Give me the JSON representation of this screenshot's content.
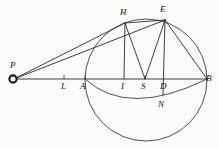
{
  "figure": {
    "kind": "geometry-diagram",
    "caption": "",
    "background_color": "#fbfbfa",
    "ink_color": "#2a2a2a",
    "width": 219,
    "height": 148
  },
  "points": [
    {
      "id": "P",
      "label": "P",
      "x": 13,
      "y": 79,
      "label_x": 10,
      "label_y": 61,
      "marker": "open-circle"
    },
    {
      "id": "L",
      "label": "L",
      "x": 64,
      "y": 79,
      "label_x": 61,
      "label_y": 82,
      "marker": "tick"
    },
    {
      "id": "A",
      "label": "A",
      "x": 85,
      "y": 79,
      "label_x": 80,
      "label_y": 82,
      "marker": "tick"
    },
    {
      "id": "I",
      "label": "I",
      "x": 124,
      "y": 79,
      "label_x": 121,
      "label_y": 82,
      "marker": "tick"
    },
    {
      "id": "S",
      "label": "S",
      "x": 145,
      "y": 79,
      "label_x": 141,
      "label_y": 82,
      "marker": "tick"
    },
    {
      "id": "D",
      "label": "D",
      "x": 163,
      "y": 79,
      "label_x": 160,
      "label_y": 82,
      "marker": "tick"
    },
    {
      "id": "B",
      "label": "B",
      "x": 207,
      "y": 79,
      "label_x": 206,
      "label_y": 74,
      "marker": "none"
    },
    {
      "id": "H",
      "label": "H",
      "x": 125,
      "y": 23,
      "label_x": 120,
      "label_y": 8,
      "marker": "none"
    },
    {
      "id": "E",
      "label": "E",
      "x": 165,
      "y": 20,
      "label_x": 160,
      "label_y": 5,
      "marker": "none"
    },
    {
      "id": "N",
      "label": "N",
      "x": 162,
      "y": 101,
      "label_x": 158,
      "label_y": 100,
      "marker": "none"
    }
  ],
  "segments": [
    {
      "id": "PB",
      "from": "P",
      "to": "B",
      "description": "baseline through L A I S D to B"
    },
    {
      "id": "PH",
      "from": "P",
      "to": "H",
      "description": "secant from P to H"
    },
    {
      "id": "PE",
      "from": "P",
      "to": "E",
      "description": "secant from P to E"
    },
    {
      "id": "HE",
      "from": "H",
      "to": "E",
      "description": "chord H to E"
    },
    {
      "id": "HI",
      "from": "H",
      "to": "I",
      "description": "perpendicular H to I"
    },
    {
      "id": "ED",
      "from": "E",
      "to": "D",
      "description": "perpendicular E to D"
    },
    {
      "id": "HS",
      "from": "H",
      "to": "S",
      "description": "radius H to S"
    },
    {
      "id": "ES",
      "from": "E",
      "to": "S",
      "description": "radius E to S"
    },
    {
      "id": "EB",
      "from": "E",
      "to": "B",
      "description": "chord E to B"
    }
  ],
  "circles": [
    {
      "id": "main-circle",
      "cx": 146,
      "cy": 80,
      "r": 61,
      "description": "circle through A H E B"
    }
  ],
  "arcs": [
    {
      "id": "arc-ANB",
      "from": "A",
      "through": "N",
      "to": "B",
      "description": "lower arc from A through N to B"
    }
  ]
}
